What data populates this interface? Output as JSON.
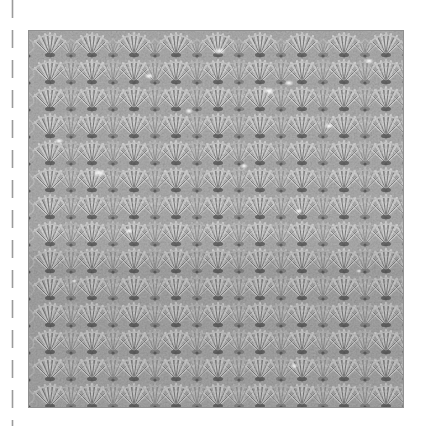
{
  "image": {
    "subject": "crochet shell stitch swatch",
    "background": "#ffffff"
  },
  "cut_line": {
    "style": "dashed",
    "color": "#9a9a9a",
    "dash_length": 18,
    "gap_length": 12
  },
  "swatch": {
    "base_color": "#a9a9a9",
    "highlight_color": "#e6e6e6",
    "shadow_color": "#5e5e5e",
    "border_color": "#8f8f8f",
    "shell_rows": 14,
    "shells_per_row": 9
  }
}
